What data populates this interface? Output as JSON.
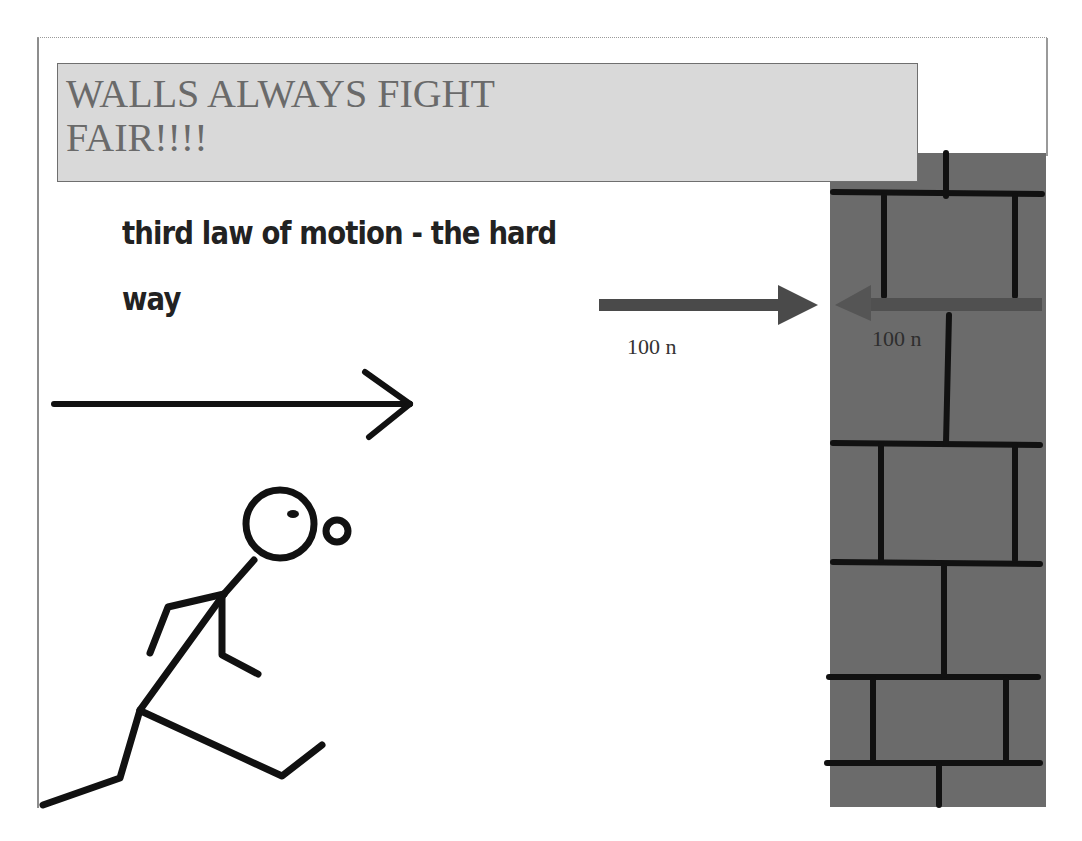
{
  "slide": {
    "title": "WALLS ALWAYS FIGHT FAIR!!!!",
    "subtitle": "third law of motion - the hard way"
  },
  "forces": {
    "action": {
      "label": "100 n",
      "direction": "right",
      "color": "#4a4a4a"
    },
    "reaction": {
      "label": "100 n",
      "direction": "left",
      "color": "#4a4a4a"
    }
  },
  "motion_arrow": {
    "icon": "arrow-right-icon",
    "direction": "right"
  },
  "figure": {
    "icon": "running-stick-figure-icon"
  },
  "wall": {
    "icon": "brick-wall-icon",
    "color": "#6b6b6b",
    "mortar_color": "#111111"
  },
  "colors": {
    "title_box": "#d9d9d9",
    "title_text": "#6a6a6a",
    "subtitle_text": "#222222"
  }
}
